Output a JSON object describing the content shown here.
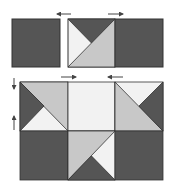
{
  "diagram": {
    "colors": {
      "dark": "#555555",
      "medium": "#c8c8c8",
      "light": "#f2f2f2",
      "outline": "#333333",
      "arrow": "#444444"
    },
    "top_row": {
      "units": [
        "dark-square",
        "half-square-triangle-unit",
        "dark-square"
      ]
    },
    "bottom_block": {
      "rows": 2,
      "cols": 3
    },
    "arrows": [
      {
        "id": "top-left-arrow",
        "direction": "left"
      },
      {
        "id": "top-right-arrow",
        "direction": "right"
      },
      {
        "id": "mid-left-arrow",
        "direction": "right"
      },
      {
        "id": "mid-right-arrow",
        "direction": "left"
      },
      {
        "id": "side-top-arrow",
        "direction": "down"
      },
      {
        "id": "side-bottom-arrow",
        "direction": "up"
      }
    ]
  }
}
